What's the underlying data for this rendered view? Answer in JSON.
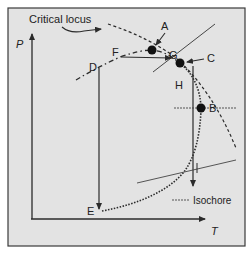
{
  "diagram": {
    "axes": {
      "y_label": "P",
      "x_label": "T"
    },
    "annotations": {
      "critical_locus": "Critical locus"
    },
    "points": {
      "A": "A",
      "B": "B",
      "C": "C",
      "D": "D",
      "E": "E",
      "F": "F",
      "G": "G",
      "H": "H"
    },
    "legend": {
      "isochore": "Isochore"
    },
    "colors": {
      "background": "#e3e3e3",
      "frame": "#3a3a3a",
      "line": "#2b2b2b",
      "outer": "#ffffff"
    }
  }
}
